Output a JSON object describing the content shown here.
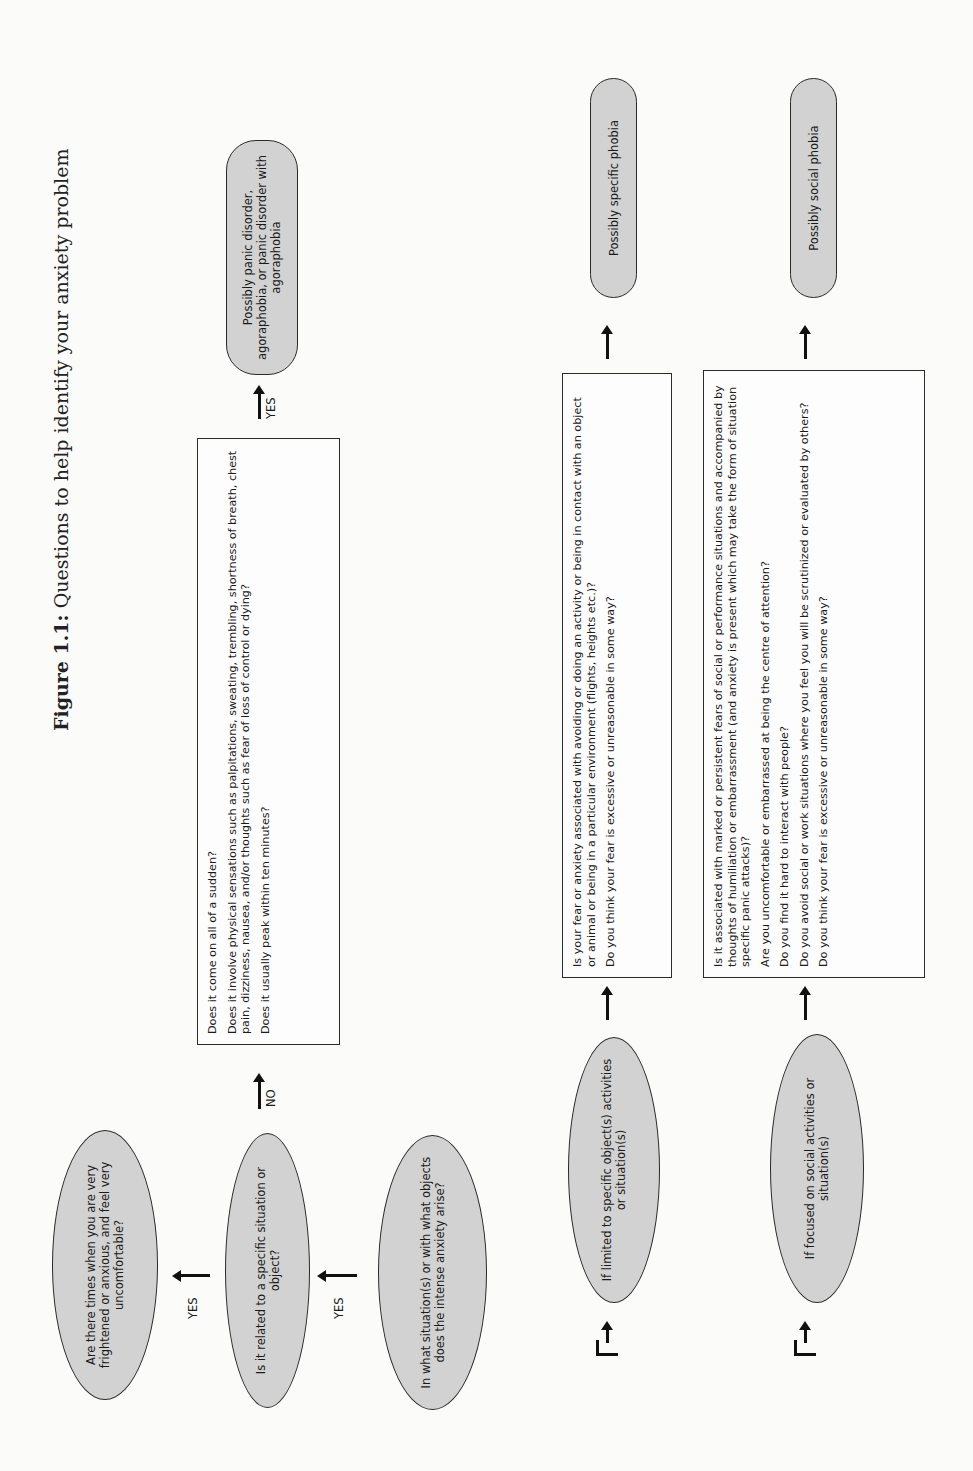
{
  "figure": {
    "title_prefix": "Figure 1.1:",
    "title_text": " Questions to help identify your anxiety problem"
  },
  "nodes": {
    "start": "Are there times when you are very frightened or anxious, and feel very uncomfortable?",
    "related": "Is it related to a specific situation or object?",
    "which_situation": "In what situation(s) or with what objects does the intense anxiety arise?",
    "limited": "If limited to specific object(s) activities or situation(s)",
    "focused": "If focused on social activities or situation(s)"
  },
  "panic_box": {
    "questions": [
      "Does it come on all of a sudden?",
      "Does it involve physical sensations such as palpitations, sweating, trembling, shortness of breath, chest pain, dizziness, nausea, and/or thoughts such as fear of loss of control or dying?",
      "Does it usually peak within ten minutes?"
    ]
  },
  "specific_box": {
    "questions": [
      "Is your fear or anxiety associated with avoiding or doing an activity or being in contact with an object or animal or being in a particular environment (flights, heights etc.)?",
      "Do you think your fear is excessive or unreasonable in some way?"
    ]
  },
  "social_box": {
    "questions": [
      "Is it associated with marked or persistent fears of social or performance situations and accompanied by thoughts of humiliation or embarrassment (and anxiety is present which may take the form of situation specific panic attacks)?",
      "Are you uncomfortable or embarrassed at being the centre of attention?",
      "Do you find it hard to interact with people?",
      "Do you avoid social or work situations where you feel you will be scrutinized or evaluated by others?",
      "Do you think your fear is excessive or unreasonable in some way?"
    ]
  },
  "outcomes": {
    "panic": "Possibly panic disorder, agoraphobia, or panic disorder with agoraphobia",
    "specific": "Possibly specific phobia",
    "social": "Possibly social phobia"
  },
  "labels": {
    "yes": "YES",
    "no": "NO"
  },
  "colors": {
    "node_fill": "#d2d2d2",
    "stroke": "#2a2a2a",
    "background": "#fbfbfa"
  }
}
